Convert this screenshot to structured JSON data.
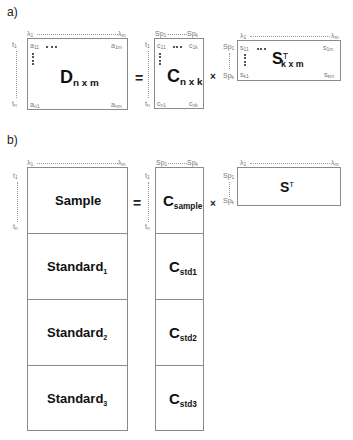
{
  "panel_a": {
    "label": "a)",
    "D": {
      "name": "D",
      "dims": "n x m",
      "col_first": "λ",
      "col_first_sub": "1",
      "col_last": "λ",
      "col_last_sub": "m",
      "row_first": "t",
      "row_first_sub": "1",
      "row_last": "t",
      "row_last_sub": "n",
      "tl": "a",
      "tl_sub": "11",
      "tr": "a",
      "tr_sub": "1m",
      "bl": "a",
      "bl_sub": "n1",
      "br": "a",
      "br_sub": "nm"
    },
    "equals": "=",
    "C": {
      "name": "C",
      "dims": "n x k",
      "col_first": "Sp",
      "col_first_sub": "1",
      "col_last": "Sp",
      "col_last_sub": "k",
      "row_first": "t",
      "row_first_sub": "1",
      "row_last": "t",
      "row_last_sub": "n",
      "tl": "c",
      "tl_sub": "11",
      "tr": "c",
      "tr_sub": "1k",
      "bl": "c",
      "bl_sub": "n1",
      "br": "c",
      "br_sub": "nk"
    },
    "times": "×",
    "S": {
      "name": "S",
      "sup": "T",
      "dims": "k x m",
      "col_first": "λ",
      "col_first_sub": "1",
      "col_last": "λ",
      "col_last_sub": "m",
      "row_first": "Sp",
      "row_first_sub": "1",
      "row_last": "Sp",
      "row_last_sub": "k",
      "tl": "s",
      "tl_sub": "11",
      "tr": "s",
      "tr_sub": "1m",
      "bl": "s",
      "bl_sub": "k1",
      "br": "s",
      "br_sub": "km"
    }
  },
  "panel_b": {
    "label": "b)",
    "D": {
      "col_first": "λ",
      "col_first_sub": "1",
      "col_last": "λ",
      "col_last_sub": "m",
      "row_first": "t",
      "row_first_sub": "1",
      "row_last": "t",
      "row_last_sub": "n",
      "rows": [
        {
          "label": "Sample",
          "sub": ""
        },
        {
          "label": "Standard",
          "sub": "1"
        },
        {
          "label": "Standard",
          "sub": "2"
        },
        {
          "label": "Standard",
          "sub": "3"
        }
      ]
    },
    "equals": "=",
    "C": {
      "col_first": "Sp",
      "col_first_sub": "1",
      "col_last": "Sp",
      "col_last_sub": "k",
      "row_first": "t",
      "row_first_sub": "1",
      "row_last": "t",
      "row_last_sub": "n",
      "rows": [
        {
          "label": "C",
          "sub": "sample"
        },
        {
          "label": "C",
          "sub": "std1"
        },
        {
          "label": "C",
          "sub": "std2"
        },
        {
          "label": "C",
          "sub": "std3"
        }
      ]
    },
    "times": "×",
    "S": {
      "name": "S",
      "sup": "T",
      "col_first": "λ",
      "col_first_sub": "1",
      "col_last": "λ",
      "col_last_sub": "m",
      "row_first": "Sp",
      "row_first_sub": "1",
      "row_last": "Sp",
      "row_last_sub": "k"
    }
  }
}
